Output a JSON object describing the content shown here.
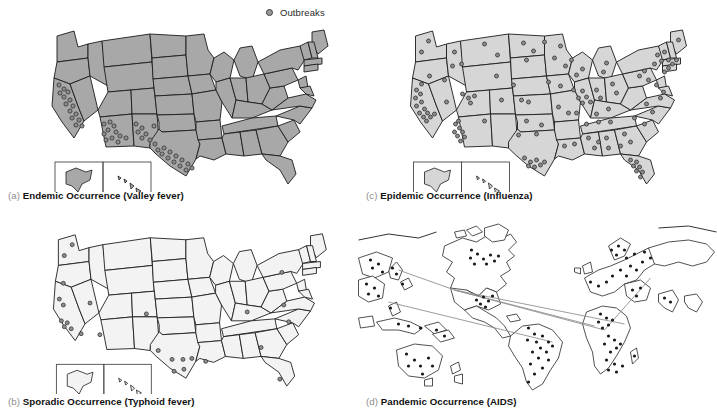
{
  "figure": {
    "legend": {
      "label": "Outbreaks",
      "marker": "outbreak-dot",
      "marker_color": "#9a9a9a"
    }
  },
  "panels": [
    {
      "id": "a",
      "index_label": "(a)",
      "caption": "Endemic Occurrence (Valley fever)",
      "pattern": "Endemic",
      "disease": "Valley fever",
      "map_type": "united-states",
      "fill_color": "#a8a8a8",
      "outline_color": "#1c1c1c",
      "has_inset": true,
      "inset_regions": [
        "Alaska",
        "Hawaii"
      ],
      "outbreak_count": 45,
      "outbreak_concentration": [
        "California",
        "Arizona",
        "New Mexico",
        "Texas",
        "Nevada"
      ]
    },
    {
      "id": "b",
      "index_label": "(b)",
      "caption": "Sporadic Occurrence (Typhoid fever)",
      "pattern": "Sporadic",
      "disease": "Typhoid fever",
      "map_type": "united-states",
      "fill_color": "#f3f3f3",
      "outline_color": "#1c1c1c",
      "has_inset": true,
      "inset_regions": [
        "Alaska",
        "Hawaii"
      ],
      "outbreak_count": 26,
      "outbreak_concentration": [
        "California",
        "Texas",
        "Eastern Seaboard"
      ]
    },
    {
      "id": "c",
      "index_label": "(c)",
      "caption": "Epidemic Occurrence (Influenza)",
      "pattern": "Epidemic",
      "disease": "Influenza",
      "map_type": "united-states",
      "fill_color": "#d6d6d6",
      "outline_color": "#1c1c1c",
      "has_inset": true,
      "inset_regions": [
        "Alaska",
        "Hawaii"
      ],
      "outbreak_count": 120,
      "outbreak_concentration": [
        "California",
        "Chicago",
        "Northeast Corridor",
        "Florida",
        "Texas"
      ]
    },
    {
      "id": "d",
      "index_label": "(d)",
      "caption": "Pandemic Occurrence (AIDS)",
      "pattern": "Pandemic",
      "disease": "AIDS",
      "map_type": "world",
      "fill_color": "#ffffff",
      "outline_color": "#262626",
      "has_inset": false,
      "inset_regions": [],
      "outbreak_count": 95,
      "outbreak_concentration": [
        "North America",
        "South America",
        "Africa",
        "Europe",
        "Asia",
        "Australia"
      ],
      "transmission_routes": 4,
      "route_color": "#8a8a8a"
    }
  ]
}
